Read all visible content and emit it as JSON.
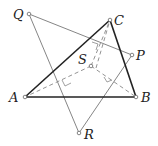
{
  "diagram": {
    "points": {
      "A": {
        "label": "A"
      },
      "B": {
        "label": "B"
      },
      "C": {
        "label": "C"
      },
      "P": {
        "label": "P"
      },
      "Q": {
        "label": "Q"
      },
      "R": {
        "label": "R"
      },
      "S": {
        "label": "S"
      }
    },
    "segments": [
      {
        "from": "A",
        "to": "B",
        "style": "bold"
      },
      {
        "from": "B",
        "to": "C",
        "style": "bold"
      },
      {
        "from": "C",
        "to": "A",
        "style": "bold"
      },
      {
        "from": "Q",
        "to": "P",
        "style": "thin"
      },
      {
        "from": "Q",
        "to": "R",
        "style": "thin"
      },
      {
        "from": "R",
        "to": "P",
        "style": "thin"
      },
      {
        "from": "S",
        "to": "A",
        "style": "dashed"
      },
      {
        "from": "S",
        "to": "B",
        "style": "dashed"
      },
      {
        "from": "S",
        "to": "C",
        "style": "dashed"
      }
    ],
    "right_angle_marks": [
      "S-A foot",
      "S-B foot",
      "S-C foot"
    ]
  }
}
